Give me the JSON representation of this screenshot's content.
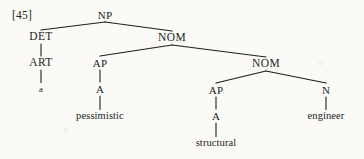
{
  "figure": {
    "example_label": "[45]",
    "kind": "phrase-structure-tree",
    "ink_color": "#211f1d",
    "page_color": "#fbfaf7"
  },
  "tree": {
    "nodes": [
      {
        "id": "np",
        "label": "NP",
        "type": "category",
        "x": 105,
        "y": 15
      },
      {
        "id": "det",
        "label": "DET",
        "type": "category",
        "x": 41,
        "y": 37
      },
      {
        "id": "nom1",
        "label": "NOM",
        "type": "category",
        "x": 172,
        "y": 38
      },
      {
        "id": "art",
        "label": "ART",
        "type": "category",
        "x": 41,
        "y": 63
      },
      {
        "id": "ap1",
        "label": "AP",
        "type": "category",
        "x": 100,
        "y": 63
      },
      {
        "id": "nom2",
        "label": "NOM",
        "type": "category",
        "x": 266,
        "y": 64
      },
      {
        "id": "a1",
        "label": "A",
        "type": "category",
        "x": 100,
        "y": 89
      },
      {
        "id": "a-word",
        "label": "a",
        "type": "terminal",
        "x": 41,
        "y": 89
      },
      {
        "id": "ap2",
        "label": "AP",
        "type": "category",
        "x": 216,
        "y": 90
      },
      {
        "id": "n",
        "label": "N",
        "type": "category",
        "x": 326,
        "y": 90
      },
      {
        "id": "pessim",
        "label": "pessimistic",
        "type": "terminal",
        "x": 100,
        "y": 116
      },
      {
        "id": "a2",
        "label": "A",
        "type": "category",
        "x": 216,
        "y": 116
      },
      {
        "id": "engineer",
        "label": "engineer",
        "type": "terminal",
        "x": 326,
        "y": 116
      },
      {
        "id": "structural",
        "label": "structural",
        "type": "terminal",
        "x": 216,
        "y": 143
      }
    ],
    "edges": [
      {
        "from": "np",
        "to": "det"
      },
      {
        "from": "np",
        "to": "nom1"
      },
      {
        "from": "det",
        "to": "art"
      },
      {
        "from": "art",
        "to": "a-word"
      },
      {
        "from": "nom1",
        "to": "ap1"
      },
      {
        "from": "nom1",
        "to": "nom2"
      },
      {
        "from": "ap1",
        "to": "a1"
      },
      {
        "from": "a1",
        "to": "pessim"
      },
      {
        "from": "nom2",
        "to": "ap2"
      },
      {
        "from": "nom2",
        "to": "n"
      },
      {
        "from": "ap2",
        "to": "a2"
      },
      {
        "from": "a2",
        "to": "structural"
      },
      {
        "from": "n",
        "to": "engineer"
      }
    ],
    "sentence": "a pessimistic structural engineer"
  }
}
